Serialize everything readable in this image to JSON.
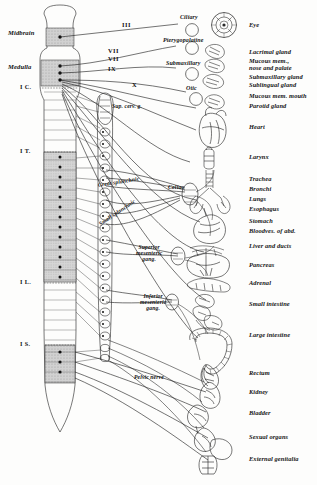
{
  "figure": {
    "background_color": "#fdfdfc",
    "ink_color": "#1a1a1a",
    "shade_color": "#b9b9b9"
  },
  "cns_regions": [
    {
      "id": "midbrain",
      "label": "Midbrain",
      "y": 33,
      "shaded": true
    },
    {
      "id": "medulla",
      "label": "Medulla",
      "y": 68,
      "shaded": true
    },
    {
      "id": "cervical",
      "label": "I C.",
      "y": 88,
      "shaded": false
    },
    {
      "id": "thoracic",
      "label": "I T.",
      "y": 152,
      "shaded": true
    },
    {
      "id": "lumbar",
      "label": "I L.",
      "y": 283,
      "shaded": true
    },
    {
      "id": "sacral",
      "label": "I S.",
      "y": 345,
      "shaded": true
    }
  ],
  "cranial_nerves": [
    {
      "numeral": "III",
      "x": 122,
      "y": 26
    },
    {
      "numeral": "VII",
      "x": 108,
      "y": 52
    },
    {
      "numeral": "VII",
      "x": 108,
      "y": 60
    },
    {
      "numeral": "IX",
      "x": 108,
      "y": 70
    },
    {
      "numeral": "X",
      "x": 130,
      "y": 85
    }
  ],
  "ganglia": [
    {
      "name": "Ciliary",
      "label": "Ciliary",
      "x": 183,
      "y": 19
    },
    {
      "name": "Pterygopalatine",
      "label": "Pterygopalatine",
      "x": 168,
      "y": 41
    },
    {
      "name": "Submaxillary",
      "label": "Submaxillary",
      "x": 170,
      "y": 63
    },
    {
      "name": "Otic",
      "label": "Otic",
      "x": 187,
      "y": 88
    },
    {
      "name": "Superior cervical",
      "label": "Sup. cerv. g.",
      "x": 112,
      "y": 106
    },
    {
      "name": "Celiac",
      "label": "Celiac",
      "x": 170,
      "y": 188
    },
    {
      "name": "Superior mesenteric",
      "label": "Superior\nmesenteric\ngang.",
      "x": 140,
      "y": 252
    },
    {
      "name": "Inferior mesenteric",
      "label": "Inferior\nmesenteric\ngang.",
      "x": 140,
      "y": 300
    }
  ],
  "ganglia_multiline": {
    "superior_mesenteric": [
      "Superior",
      "mesenteric",
      "gang."
    ],
    "inferior_mesenteric": [
      "Inferior",
      "mesenteric",
      "gang."
    ]
  },
  "nerve_trunks": [
    {
      "name": "great-splanchnic",
      "label": "Great splanchnic",
      "x": 98,
      "y": 186
    },
    {
      "name": "small-splanchnic",
      "label": "Small splanchnic",
      "x": 100,
      "y": 222
    },
    {
      "name": "pelvic-nerve",
      "label": "Pelvic nerve",
      "x": 134,
      "y": 378
    }
  ],
  "organs": [
    {
      "name": "eye",
      "label": "Eye",
      "y": 26
    },
    {
      "name": "lacrimal-gland",
      "label": "Lacrimal gland",
      "y": 53
    },
    {
      "name": "mucous-mem-nose",
      "label": "Mucous mem.,",
      "y": 62,
      "line2": "nose and palate"
    },
    {
      "name": "submaxillary-gland",
      "label": "Submaxillary gland",
      "y": 77
    },
    {
      "name": "sublingual-gland",
      "label": "Sublingual gland",
      "y": 85
    },
    {
      "name": "mucous-mem-mouth",
      "label": "Mucous mem. mouth",
      "y": 96
    },
    {
      "name": "parotid-gland",
      "label": "Parotid gland",
      "y": 106
    },
    {
      "name": "heart",
      "label": "Heart",
      "y": 127
    },
    {
      "name": "larynx",
      "label": "Larynx",
      "y": 157
    },
    {
      "name": "trachea",
      "label": "Trachea",
      "y": 179
    },
    {
      "name": "bronchi",
      "label": "Bronchi",
      "y": 189
    },
    {
      "name": "lungs",
      "label": "Lungs",
      "y": 199
    },
    {
      "name": "esophagus",
      "label": "Esophagus",
      "y": 209
    },
    {
      "name": "stomach",
      "label": "Stomach",
      "y": 221
    },
    {
      "name": "bloodves-of-abd",
      "label": "Bloodves. of abd.",
      "y": 231
    },
    {
      "name": "liver-and-ducts",
      "label": "Liver and ducts",
      "y": 246
    },
    {
      "name": "pancreas",
      "label": "Pancreas",
      "y": 265
    },
    {
      "name": "adrenal",
      "label": "Adrenal",
      "y": 283
    },
    {
      "name": "small-intestine",
      "label": "Small intestine",
      "y": 304
    },
    {
      "name": "large-intestine",
      "label": "Large intestine",
      "y": 335
    },
    {
      "name": "rectum",
      "label": "Rectum",
      "y": 373
    },
    {
      "name": "kidney",
      "label": "Kidney",
      "y": 392
    },
    {
      "name": "bladder",
      "label": "Bladder",
      "y": 413
    },
    {
      "name": "sexual-organs",
      "label": "Sexual organs",
      "y": 437
    },
    {
      "name": "external-genitalia",
      "label": "External genitalia",
      "y": 459
    }
  ],
  "layout": {
    "organ_label_x": 249,
    "cord_center_x": 60,
    "chain_center_x": 104
  }
}
